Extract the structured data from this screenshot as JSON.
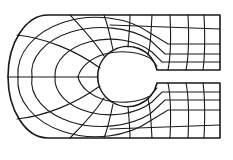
{
  "diagram": {
    "type": "structured-mesh",
    "colors": {
      "background": "#ffffff",
      "lines": "#1a1a1a"
    },
    "geometry": {
      "top_y": 15,
      "bottom_y": 138,
      "right_x": 220,
      "left_arc_center": [
        48,
        77
      ],
      "hole_center": [
        127,
        77
      ],
      "hole_radius": 30,
      "slot_top_y": 70,
      "slot_bottom_y": 83,
      "slot_start_x": 157
    },
    "radial_rings": 4,
    "right_columns_x": [
      170,
      188,
      204
    ],
    "right_rows_top_y": [
      15,
      29,
      47,
      61
    ],
    "right_rows_bottom_y": [
      92,
      107,
      122,
      138
    ]
  }
}
